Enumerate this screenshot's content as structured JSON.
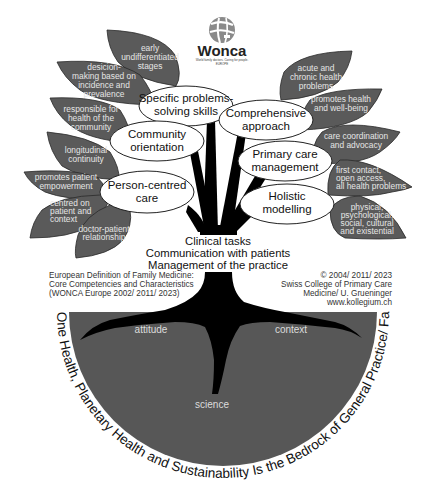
{
  "logo": {
    "name": "Wonca",
    "tagline": "World family doctors. Caring for people.",
    "region": "EUROPE"
  },
  "left_leaves": [
    {
      "lines": [
        "early",
        "undifferentiated",
        "stages"
      ]
    },
    {
      "lines": [
        "desicion-",
        "making based on",
        "incidence and",
        "prevalence"
      ]
    },
    {
      "lines": [
        "responsible for",
        "health of the",
        "community"
      ]
    },
    {
      "lines": [
        "longitudinal",
        "continuity"
      ]
    },
    {
      "lines": [
        "promotes patient",
        "empowerment"
      ]
    },
    {
      "lines": [
        "centred on",
        "patient and",
        "context"
      ]
    },
    {
      "lines": [
        "doctor-patient",
        "relationship"
      ]
    }
  ],
  "right_leaves": [
    {
      "lines": [
        "acute and",
        "chronic health",
        "problems"
      ]
    },
    {
      "lines": [
        "promotes health",
        "and well-being"
      ]
    },
    {
      "lines": [
        "care coordination",
        "and advocacy"
      ]
    },
    {
      "lines": [
        "first contact,",
        "open access,",
        "all health problems"
      ]
    },
    {
      "lines": [
        "physical,",
        "psychological,",
        "social, cultural",
        "and existential"
      ]
    }
  ],
  "competencies": [
    {
      "lines": [
        "Specific problems-",
        "solving skills"
      ]
    },
    {
      "lines": [
        "Comprehensive",
        "approach"
      ]
    },
    {
      "lines": [
        "Community",
        "orientation"
      ]
    },
    {
      "lines": [
        "Primary care",
        "management"
      ]
    },
    {
      "lines": [
        "Person-centred",
        "care"
      ]
    },
    {
      "lines": [
        "Holistic",
        "modelling"
      ]
    }
  ],
  "clinical_tasks": [
    "Clinical tasks",
    "Communication with patients",
    "Management of the practice"
  ],
  "credits_left": [
    "European Definition of Family Medicine:",
    "Core Competencies and Characteristics",
    "(WONCA Europe 2002/ 2011/ 2023)"
  ],
  "credits_right": [
    "© 2004/ 2011/ 2023",
    "Swiss College of Primary Care",
    "Medicine/ U. Grueninger",
    "www.kollegium.ch"
  ],
  "roots": {
    "left": "attitude",
    "right": "context",
    "bottom": "science"
  },
  "bedrock_text": "One Health, Planetary Health and Sustainability Is the Bedrock of General Practice/ Family Medicine",
  "colors": {
    "leaf": "#5a5a5a",
    "ground": "#575757",
    "trunk": "#000000",
    "background": "#ffffff"
  }
}
